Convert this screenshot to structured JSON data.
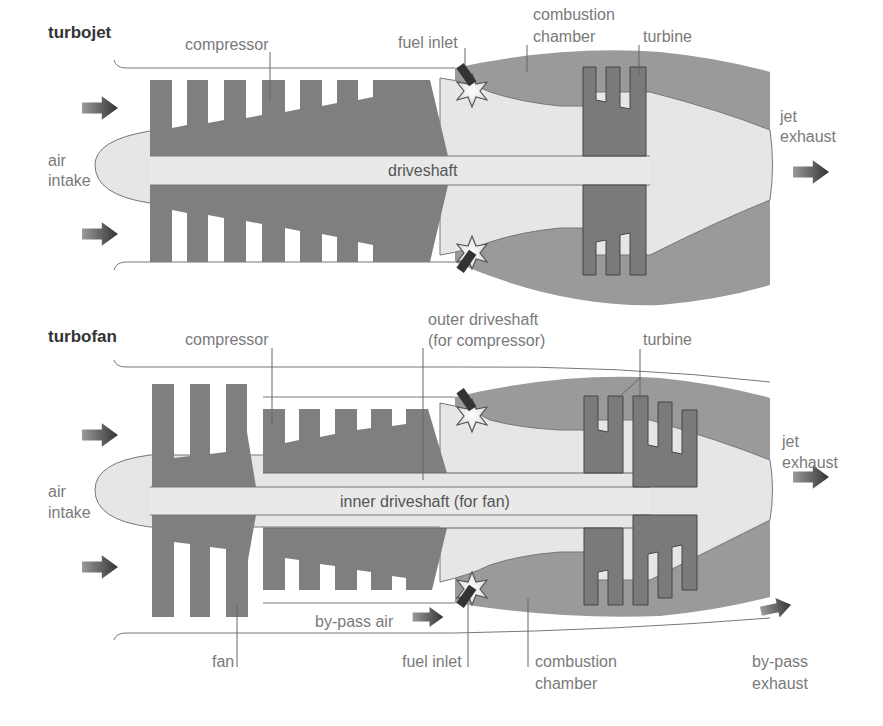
{
  "colors": {
    "casing": "#9a9a9a",
    "compressor": "#7f7f7f",
    "turbine": "#8a8a8a",
    "shaft": "#e6e6e6",
    "outline": "#555555",
    "label": "#7a7a7a",
    "title": "#333333",
    "arrow": "#444444",
    "background": "#ffffff"
  },
  "turbojet": {
    "title": "turbojet",
    "labels": {
      "compressor": "compressor",
      "fuel_inlet": "fuel inlet",
      "combustion_line1": "combustion",
      "combustion_line2": "chamber",
      "turbine": "turbine",
      "air_line1": "air",
      "air_line2": "intake",
      "driveshaft": "driveshaft",
      "jet_line1": "jet",
      "jet_line2": "exhaust"
    }
  },
  "turbofan": {
    "title": "turbofan",
    "labels": {
      "compressor": "compressor",
      "outer_line1": "outer driveshaft",
      "outer_line2": "(for compressor)",
      "turbine": "turbine",
      "air_line1": "air",
      "air_line2": "intake",
      "inner_driveshaft": "inner driveshaft (for fan)",
      "jet_line1": "jet",
      "jet_line2": "exhaust",
      "bypass_air": "by-pass air",
      "fan": "fan",
      "fuel_inlet": "fuel inlet",
      "combustion_line1": "combustion",
      "combustion_line2": "chamber",
      "bypass_exhaust_line1": "by-pass",
      "bypass_exhaust_line2": "exhaust"
    }
  }
}
